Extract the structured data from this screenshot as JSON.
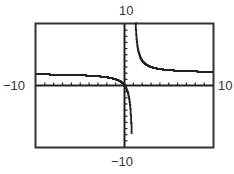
{
  "chart_data": {
    "type": "line",
    "title": "",
    "xlabel": "",
    "ylabel": "",
    "xlim": [
      -10,
      10
    ],
    "ylim": [
      -10,
      10
    ],
    "x_tick_step": 1,
    "y_tick_step": 1,
    "grid": false,
    "window_labels": {
      "xmin": "−10",
      "xmax": "10",
      "ymin": "−10",
      "ymax": "10"
    },
    "vertical_asymptote_x": 1,
    "horizontal_asymptote_y": 2,
    "series": [
      {
        "name": "f(x)",
        "description": "rational function with vertical asymptote near x=1, horizontal asymptote near y=2, passing through origin",
        "x": [
          -10,
          -8,
          -6,
          -4,
          -2,
          -1,
          -0.5,
          0,
          0.3,
          0.5,
          0.7,
          0.8,
          1.2,
          1.3,
          1.5,
          2,
          3,
          4,
          6,
          8,
          10
        ],
        "y": [
          1.8,
          1.8,
          1.7,
          1.6,
          1.3,
          1.0,
          0.7,
          0,
          -0.9,
          -2,
          -4.7,
          -8,
          12,
          8.7,
          6,
          4,
          3,
          2.7,
          2.4,
          2.3,
          2.2
        ]
      }
    ]
  }
}
